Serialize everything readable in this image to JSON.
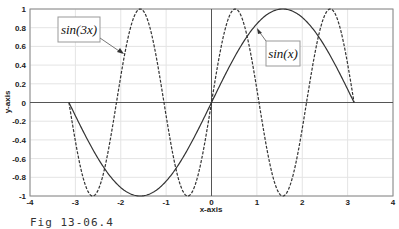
{
  "chart_data": {
    "type": "line",
    "title": "",
    "xlabel": "x-axis",
    "ylabel": "y-axis",
    "xlim": [
      -4,
      4
    ],
    "ylim": [
      -1,
      1
    ],
    "grid": true,
    "x_ticks": [
      -4,
      -3,
      -2,
      -1,
      0,
      1,
      2,
      3,
      4
    ],
    "y_ticks": [
      -1,
      -0.8,
      -0.6,
      -0.4,
      -0.2,
      0,
      0.2,
      0.4,
      0.6,
      0.8,
      1
    ],
    "series": [
      {
        "name": "sin(x)",
        "style": "solid",
        "domain": [
          -3.1416,
          3.1416
        ],
        "function": "sin(x)",
        "x": [
          -3.14,
          -2.36,
          -1.57,
          -0.79,
          0,
          0.79,
          1.57,
          2.36,
          3.14
        ],
        "values": [
          0,
          -0.71,
          -1,
          -0.71,
          0,
          0.71,
          1,
          0.71,
          0
        ]
      },
      {
        "name": "sin(3x)",
        "style": "dashed",
        "domain": [
          -3.1416,
          3.1416
        ],
        "function": "sin(3x)",
        "x": [
          -3.14,
          -2.62,
          -2.09,
          -1.57,
          -1.05,
          -0.52,
          0,
          0.52,
          1.05,
          1.57,
          2.09,
          2.62,
          3.14
        ],
        "values": [
          0,
          -1,
          0,
          1,
          0,
          -1,
          0,
          1,
          0,
          -1,
          0,
          1,
          0
        ]
      }
    ],
    "annotations": [
      {
        "text": "sin(3x)",
        "target_series": "sin(3x)"
      },
      {
        "text": "sin(x)",
        "target_series": "sin(x)"
      }
    ],
    "legend": "none (text-arrow annotations)"
  },
  "caption": "Fig 13-06.4"
}
